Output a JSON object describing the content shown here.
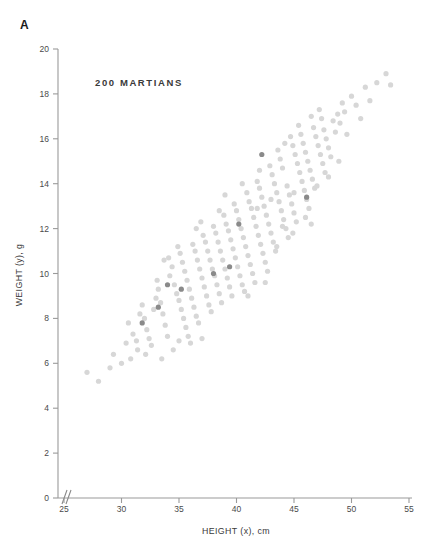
{
  "figure": {
    "panel_label": "A",
    "annotation": "200 MARTIANS"
  },
  "chart_data": {
    "type": "scatter",
    "title": "",
    "annotation": "200 MARTIANS",
    "panel": "A",
    "xlabel": "HEIGHT (x), cm",
    "ylabel": "WEIGHT (y), g",
    "xlim": [
      25,
      55
    ],
    "ylim": [
      0,
      20
    ],
    "xticks": [
      25,
      30,
      35,
      40,
      45,
      50,
      55
    ],
    "yticks": [
      0,
      2,
      4,
      6,
      8,
      10,
      12,
      14,
      16,
      18,
      20
    ],
    "grid": false,
    "legend": null,
    "axis_break": {
      "axis": "x",
      "near": 25,
      "symbol": "//"
    },
    "marker": {
      "shape": "circle",
      "radius_px": 2.6
    },
    "colors": {
      "point_light": "#d7d7d7",
      "point_dark": "#8a8a8a",
      "axis": "#9a9a9a",
      "text": "#3a3a3a",
      "background": "#ffffff"
    },
    "series": [
      {
        "name": "martians",
        "color": "#d7d7d7",
        "points": [
          [
            27.0,
            5.6
          ],
          [
            28.0,
            5.2
          ],
          [
            29.3,
            6.4
          ],
          [
            30.0,
            6.0
          ],
          [
            30.4,
            6.9
          ],
          [
            31.0,
            7.3
          ],
          [
            31.3,
            7.0
          ],
          [
            31.4,
            6.6
          ],
          [
            30.6,
            7.8
          ],
          [
            31.6,
            8.2
          ],
          [
            31.8,
            8.6
          ],
          [
            32.0,
            8.0
          ],
          [
            32.2,
            7.5
          ],
          [
            32.4,
            7.1
          ],
          [
            32.6,
            6.8
          ],
          [
            32.8,
            8.4
          ],
          [
            33.0,
            8.9
          ],
          [
            33.2,
            9.3
          ],
          [
            33.4,
            8.7
          ],
          [
            33.6,
            8.2
          ],
          [
            33.8,
            7.7
          ],
          [
            34.0,
            7.2
          ],
          [
            33.1,
            9.7
          ],
          [
            34.2,
            9.9
          ],
          [
            34.4,
            10.3
          ],
          [
            34.6,
            9.5
          ],
          [
            34.8,
            9.1
          ],
          [
            35.0,
            8.8
          ],
          [
            35.2,
            8.4
          ],
          [
            35.4,
            8.0
          ],
          [
            35.6,
            7.6
          ],
          [
            35.8,
            7.2
          ],
          [
            34.1,
            10.7
          ],
          [
            35.1,
            10.9
          ],
          [
            35.3,
            10.5
          ],
          [
            35.5,
            10.1
          ],
          [
            35.7,
            9.7
          ],
          [
            35.9,
            9.3
          ],
          [
            36.1,
            8.9
          ],
          [
            36.3,
            8.5
          ],
          [
            36.5,
            8.1
          ],
          [
            36.7,
            7.8
          ],
          [
            36.2,
            11.3
          ],
          [
            36.4,
            11.0
          ],
          [
            36.6,
            10.6
          ],
          [
            36.8,
            10.2
          ],
          [
            37.0,
            9.8
          ],
          [
            37.2,
            9.4
          ],
          [
            37.4,
            9.0
          ],
          [
            37.6,
            8.6
          ],
          [
            37.8,
            8.3
          ],
          [
            37.1,
            11.7
          ],
          [
            37.3,
            11.4
          ],
          [
            37.5,
            11.0
          ],
          [
            37.7,
            10.6
          ],
          [
            37.9,
            10.2
          ],
          [
            38.1,
            9.9
          ],
          [
            38.3,
            9.5
          ],
          [
            38.5,
            9.1
          ],
          [
            38.7,
            8.7
          ],
          [
            38.0,
            12.1
          ],
          [
            38.2,
            11.8
          ],
          [
            38.4,
            11.4
          ],
          [
            38.6,
            11.0
          ],
          [
            38.8,
            10.6
          ],
          [
            39.0,
            10.2
          ],
          [
            39.2,
            9.8
          ],
          [
            39.4,
            9.4
          ],
          [
            39.6,
            9.0
          ],
          [
            38.9,
            12.6
          ],
          [
            39.1,
            12.2
          ],
          [
            39.3,
            11.9
          ],
          [
            39.5,
            11.5
          ],
          [
            39.7,
            11.1
          ],
          [
            39.9,
            10.7
          ],
          [
            40.1,
            10.3
          ],
          [
            40.3,
            9.9
          ],
          [
            40.5,
            9.5
          ],
          [
            40.7,
            9.2
          ],
          [
            39.8,
            13.1
          ],
          [
            40.0,
            12.8
          ],
          [
            40.2,
            12.4
          ],
          [
            40.4,
            12.0
          ],
          [
            40.6,
            11.6
          ],
          [
            40.8,
            11.2
          ],
          [
            41.0,
            10.8
          ],
          [
            41.2,
            10.4
          ],
          [
            41.4,
            10.0
          ],
          [
            41.6,
            9.6
          ],
          [
            40.9,
            13.6
          ],
          [
            41.1,
            13.2
          ],
          [
            41.3,
            12.9
          ],
          [
            41.5,
            12.5
          ],
          [
            41.7,
            12.1
          ],
          [
            41.9,
            11.7
          ],
          [
            42.1,
            11.3
          ],
          [
            42.3,
            10.9
          ],
          [
            42.5,
            10.5
          ],
          [
            42.7,
            10.1
          ],
          [
            41.8,
            14.1
          ],
          [
            42.0,
            13.8
          ],
          [
            42.2,
            13.4
          ],
          [
            42.4,
            13.0
          ],
          [
            42.6,
            12.6
          ],
          [
            42.8,
            12.2
          ],
          [
            43.0,
            11.8
          ],
          [
            43.2,
            11.4
          ],
          [
            43.4,
            11.0
          ],
          [
            42.9,
            14.8
          ],
          [
            43.1,
            14.4
          ],
          [
            43.3,
            14.0
          ],
          [
            43.5,
            13.6
          ],
          [
            43.7,
            13.2
          ],
          [
            43.9,
            12.8
          ],
          [
            44.1,
            12.4
          ],
          [
            44.3,
            12.0
          ],
          [
            44.5,
            11.6
          ],
          [
            43.6,
            15.5
          ],
          [
            43.8,
            15.1
          ],
          [
            44.0,
            14.7
          ],
          [
            44.2,
            15.8
          ],
          [
            44.4,
            13.9
          ],
          [
            44.6,
            13.5
          ],
          [
            44.8,
            13.1
          ],
          [
            45.0,
            12.7
          ],
          [
            45.2,
            12.3
          ],
          [
            44.7,
            16.1
          ],
          [
            44.9,
            15.7
          ],
          [
            45.1,
            15.3
          ],
          [
            45.3,
            14.9
          ],
          [
            45.5,
            14.5
          ],
          [
            45.7,
            14.1
          ],
          [
            45.9,
            13.7
          ],
          [
            46.1,
            13.3
          ],
          [
            46.3,
            12.9
          ],
          [
            45.4,
            16.6
          ],
          [
            45.6,
            16.2
          ],
          [
            45.8,
            15.8
          ],
          [
            46.0,
            15.4
          ],
          [
            46.2,
            15.0
          ],
          [
            46.4,
            14.6
          ],
          [
            46.6,
            14.2
          ],
          [
            46.8,
            13.8
          ],
          [
            46.5,
            17.0
          ],
          [
            46.7,
            16.5
          ],
          [
            46.9,
            16.1
          ],
          [
            47.1,
            15.7
          ],
          [
            47.3,
            15.3
          ],
          [
            47.5,
            14.9
          ],
          [
            47.7,
            14.5
          ],
          [
            47.2,
            17.3
          ],
          [
            47.4,
            16.9
          ],
          [
            47.6,
            16.4
          ],
          [
            47.8,
            16.0
          ],
          [
            48.0,
            15.6
          ],
          [
            48.2,
            15.2
          ],
          [
            48.4,
            16.8
          ],
          [
            48.6,
            16.3
          ],
          [
            48.8,
            17.1
          ],
          [
            49.0,
            16.7
          ],
          [
            49.2,
            17.6
          ],
          [
            49.4,
            17.2
          ],
          [
            49.6,
            16.2
          ],
          [
            50.0,
            17.9
          ],
          [
            50.4,
            17.5
          ],
          [
            50.8,
            16.9
          ],
          [
            51.2,
            18.3
          ],
          [
            51.6,
            17.7
          ],
          [
            52.2,
            18.5
          ],
          [
            53.0,
            18.9
          ],
          [
            53.4,
            18.4
          ],
          [
            48.9,
            15.0
          ],
          [
            36.0,
            6.9
          ],
          [
            34.5,
            6.6
          ],
          [
            33.5,
            6.2
          ],
          [
            37.0,
            7.1
          ],
          [
            35.0,
            7.0
          ],
          [
            30.8,
            6.2
          ],
          [
            32.1,
            6.4
          ],
          [
            36.9,
            12.3
          ],
          [
            38.5,
            12.8
          ],
          [
            41.8,
            12.9
          ],
          [
            43.0,
            13.3
          ],
          [
            44.0,
            12.1
          ],
          [
            45.0,
            13.6
          ],
          [
            46.0,
            12.5
          ],
          [
            47.0,
            13.9
          ],
          [
            48.0,
            14.3
          ],
          [
            29.0,
            5.8
          ],
          [
            39.0,
            13.5
          ],
          [
            40.5,
            14.0
          ],
          [
            42.0,
            14.6
          ],
          [
            36.5,
            12.0
          ],
          [
            34.9,
            11.2
          ],
          [
            33.7,
            10.6
          ],
          [
            43.5,
            11.2
          ],
          [
            44.9,
            11.8
          ],
          [
            46.5,
            12.2
          ],
          [
            41.0,
            9.0
          ],
          [
            42.5,
            9.6
          ]
        ]
      },
      {
        "name": "martians-highlighted",
        "color": "#8a8a8a",
        "points": [
          [
            31.8,
            7.8
          ],
          [
            33.2,
            8.5
          ],
          [
            34.0,
            9.5
          ],
          [
            35.2,
            9.3
          ],
          [
            38.0,
            10.0
          ],
          [
            39.4,
            10.3
          ],
          [
            40.2,
            12.2
          ],
          [
            42.2,
            15.3
          ],
          [
            46.1,
            13.4
          ]
        ]
      }
    ]
  },
  "axes": {
    "x": {
      "label": "HEIGHT (x), cm",
      "tick_labels": [
        "25",
        "30",
        "35",
        "40",
        "45",
        "50",
        "55"
      ]
    },
    "y": {
      "label": "WEIGHT (y), g",
      "tick_labels": [
        "0",
        "2",
        "4",
        "6",
        "8",
        "10",
        "12",
        "14",
        "16",
        "18",
        "20"
      ]
    }
  }
}
